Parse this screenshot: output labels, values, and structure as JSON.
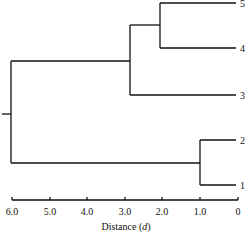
{
  "diagram": {
    "type": "dendrogram",
    "orientation": "horizontal",
    "axis": {
      "label": "Distance",
      "label_var": "d",
      "ticks": [
        "6.0",
        "5.0",
        "4.0",
        "3.0",
        "2.0",
        "1.0",
        "0"
      ]
    },
    "leaves": [
      "5",
      "4",
      "3",
      "2",
      "1"
    ],
    "merges": [
      {
        "members": [
          "5",
          "4"
        ],
        "distance": 2.1
      },
      {
        "members": [
          "5",
          "4",
          "3"
        ],
        "distance": 2.8
      },
      {
        "members": [
          "2",
          "1"
        ],
        "distance": 1.0
      },
      {
        "members": [
          "5",
          "4",
          "3",
          "2",
          "1"
        ],
        "distance": 5.9
      }
    ]
  }
}
